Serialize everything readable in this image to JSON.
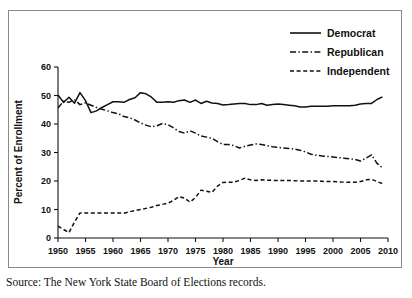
{
  "source_note": "Source: The New York State Board of Elections records.",
  "chart_data": {
    "type": "line",
    "title": "",
    "xlabel": "Year",
    "ylabel": "Percent of Enrollment",
    "xlim": [
      1950,
      2010
    ],
    "ylim": [
      0,
      60
    ],
    "grid": false,
    "legend_position": "top-right",
    "xticks": [
      1950,
      1955,
      1960,
      1965,
      1970,
      1975,
      1980,
      1985,
      1990,
      1995,
      2000,
      2005,
      2010
    ],
    "xtick_labels": [
      "1950",
      "1955",
      "1960",
      "1965",
      "1970",
      "1975",
      "1980",
      "1985",
      "1990",
      "1995",
      "2000",
      "2005",
      "2010"
    ],
    "yticks": [
      0,
      10,
      20,
      30,
      40,
      50,
      60
    ],
    "ytick_labels": [
      "0",
      "10",
      "20",
      "30",
      "40",
      "50",
      "60"
    ],
    "x": [
      1950,
      1951,
      1952,
      1953,
      1954,
      1955,
      1956,
      1957,
      1958,
      1959,
      1960,
      1961,
      1962,
      1963,
      1964,
      1965,
      1966,
      1967,
      1968,
      1969,
      1970,
      1971,
      1972,
      1973,
      1974,
      1975,
      1976,
      1977,
      1978,
      1979,
      1980,
      1981,
      1982,
      1983,
      1984,
      1985,
      1986,
      1987,
      1988,
      1989,
      1990,
      1991,
      1992,
      1993,
      1994,
      1995,
      1996,
      1997,
      1998,
      1999,
      2000,
      2001,
      2002,
      2003,
      2004,
      2005,
      2006,
      2007,
      2008,
      2009
    ],
    "series": [
      {
        "name": "Democrat",
        "linestyle": "solid",
        "color": "#111111",
        "values": [
          50.2,
          47.6,
          49.4,
          47.3,
          51.0,
          48.2,
          44.0,
          44.6,
          45.8,
          46.8,
          47.8,
          47.8,
          47.6,
          48.6,
          49.2,
          51.0,
          50.6,
          49.4,
          47.6,
          47.6,
          47.8,
          47.6,
          48.2,
          48.4,
          47.6,
          48.4,
          47.2,
          48.0,
          47.4,
          47.2,
          46.7,
          46.8,
          47.0,
          47.2,
          47.2,
          46.8,
          46.8,
          47.2,
          46.6,
          46.8,
          47.0,
          46.8,
          46.6,
          46.4,
          46.0,
          46.0,
          46.2,
          46.2,
          46.2,
          46.2,
          46.4,
          46.4,
          46.4,
          46.4,
          46.6,
          47.0,
          47.2,
          47.2,
          48.6,
          49.5
        ]
      },
      {
        "name": "Republican",
        "linestyle": "dashdot",
        "color": "#111111",
        "values": [
          45.6,
          48.0,
          47.6,
          48.6,
          46.8,
          47.4,
          46.6,
          45.8,
          45.2,
          44.6,
          44.0,
          43.6,
          42.6,
          42.2,
          41.4,
          40.4,
          39.6,
          39.0,
          39.4,
          40.2,
          39.8,
          38.6,
          37.4,
          36.8,
          37.6,
          36.8,
          35.8,
          35.4,
          35.0,
          33.8,
          32.8,
          32.8,
          32.4,
          31.6,
          32.2,
          32.6,
          33.0,
          32.8,
          32.4,
          32.0,
          31.8,
          31.6,
          31.4,
          31.2,
          30.8,
          30.2,
          29.4,
          29.0,
          28.8,
          28.6,
          28.4,
          28.2,
          28.0,
          27.8,
          27.6,
          27.0,
          28.0,
          29.2,
          26.2,
          24.6
        ]
      },
      {
        "name": "Independent",
        "linestyle": "dashed",
        "color": "#111111",
        "values": [
          4.2,
          3.0,
          1.9,
          5.6,
          8.8,
          8.8,
          8.8,
          8.8,
          8.8,
          8.8,
          8.8,
          8.8,
          8.7,
          9.2,
          9.6,
          10.0,
          10.4,
          10.8,
          11.4,
          11.8,
          12.2,
          13.2,
          14.5,
          14.0,
          12.6,
          14.2,
          16.8,
          16.4,
          16.0,
          18.2,
          19.5,
          19.6,
          19.6,
          20.2,
          21.0,
          20.4,
          20.2,
          20.4,
          20.3,
          20.2,
          20.2,
          20.2,
          20.2,
          20.1,
          20.0,
          20.0,
          20.0,
          20.0,
          19.9,
          19.8,
          19.8,
          19.7,
          19.6,
          19.6,
          19.6,
          19.8,
          20.4,
          20.6,
          19.8,
          19.1
        ]
      }
    ]
  }
}
